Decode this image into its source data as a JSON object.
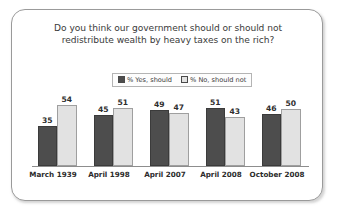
{
  "card": {
    "border_color": "#9a9a9a",
    "background": "#ffffff"
  },
  "chart_data": {
    "type": "bar",
    "title_line1": "Do you think our government should or should not",
    "title_line2": "redistribute wealth by heavy taxes on the rich?",
    "title": "Do you think our government should or should not redistribute wealth by heavy taxes on the rich?",
    "categories": [
      "March 1939",
      "April 1998",
      "April 2007",
      "April 2008",
      "October 2008"
    ],
    "series": [
      {
        "name": "% Yes, should",
        "color": "#4d4d4d",
        "values": [
          35,
          45,
          49,
          51,
          46
        ]
      },
      {
        "name": "% No, should not",
        "color": "#e2e2e2",
        "values": [
          54,
          51,
          47,
          43,
          50
        ]
      }
    ],
    "xlabel": "",
    "ylabel": "",
    "ylim": [
      0,
      60
    ],
    "grid": false,
    "legend_position": "top-center",
    "value_labels": true
  },
  "legend": {
    "items": [
      {
        "label": "% Yes, should",
        "swatch": "#4d4d4d"
      },
      {
        "label": "% No, should not",
        "swatch": "#e2e2e2"
      }
    ]
  }
}
